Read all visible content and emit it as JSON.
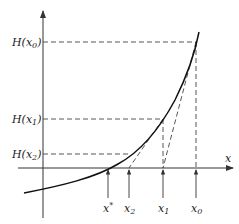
{
  "diagram": {
    "axis_x_label": "x",
    "y_labels": [
      {
        "id": "Hx0",
        "main": "H(x",
        "sub": "0",
        "close": ")"
      },
      {
        "id": "Hx1",
        "main": "H(x",
        "sub": "1",
        "close": ")"
      },
      {
        "id": "Hx2",
        "main": "H(x",
        "sub": "2",
        "close": ")"
      }
    ],
    "x_labels": [
      {
        "id": "xstar",
        "main": "x",
        "sup": "*"
      },
      {
        "id": "x2",
        "main": "x",
        "sub": "2"
      },
      {
        "id": "x1",
        "main": "x",
        "sub": "1"
      },
      {
        "id": "x0",
        "main": "x",
        "sub": "0"
      }
    ],
    "colors": {
      "curve": "#111111",
      "axis": "#333333",
      "dashed": "#444444"
    }
  }
}
